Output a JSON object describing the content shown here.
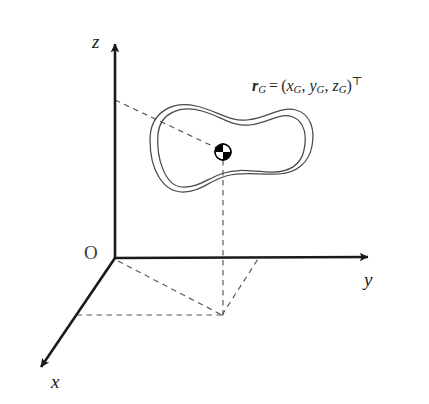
{
  "figure": {
    "type": "coordinate-frame-rigid-body-diagram",
    "background_color": "#ffffff",
    "width": 429,
    "height": 404,
    "stroke_color": "#1a1a1a",
    "dashed_color": "#555555",
    "body_outline_color": "#4a4a4a"
  },
  "axes": {
    "origin_label": "O",
    "x_label": "x",
    "y_label": "y",
    "z_label": "z",
    "origin_point": {
      "x": 115,
      "y": 258
    },
    "x_axis_tip": {
      "x": 33,
      "y": 375
    },
    "y_axis_tip": {
      "x": 378,
      "y": 257
    },
    "z_axis_tip": {
      "x": 115,
      "y": 35
    }
  },
  "vector": {
    "label_r": "r",
    "label_r_sub": "G",
    "equals": "=",
    "open_paren": "(",
    "comp_x": "x",
    "comp_x_sub": "G",
    "comma_1": ",",
    "comp_y": "y",
    "comp_y_sub": "G",
    "comma_2": ",",
    "comp_z": "z",
    "comp_z_sub": "G",
    "close_paren": ")",
    "transpose": "⊤",
    "tail_point": {
      "x": 115,
      "y": 100
    },
    "head_point": {
      "x": 223,
      "y": 152
    }
  },
  "center_of_mass": {
    "marker_name": "center-of-mass-symbol",
    "center": {
      "x": 223,
      "y": 152
    },
    "radius": 8,
    "filled_quadrants": "upper-left,lower-right",
    "fill_color": "#000000",
    "empty_color": "#ffffff"
  },
  "projection": {
    "foot_point": {
      "x": 223,
      "y": 315
    },
    "x_axis_intercept": {
      "x": 78,
      "y": 315
    },
    "y_axis_intercept": {
      "x": 258,
      "y": 258
    }
  },
  "rigid_body": {
    "name": "rigid-body-blob",
    "outer_contour": "M 150 140 C 150 112, 172 101, 196 106 C 216 110, 229 122, 247 120 C 268 118, 280 106, 296 110 C 311 114, 315 130, 312 146 C 309 163, 296 173, 279 174 C 258 175, 243 171, 226 176 C 209 181, 200 192, 183 192 C 163 192, 150 170, 150 140 Z",
    "inner_contour": "M 158 134 C 160 113, 180 105, 202 111 C 221 116, 232 127, 250 125 C 269 123, 279 112, 293 117 C 305 122, 307 136, 304 150 C 301 165, 289 172, 273 172 C 253 172, 240 168, 224 173 C 208 178, 198 188, 182 187 C 165 186, 156 158, 158 134 Z"
  }
}
